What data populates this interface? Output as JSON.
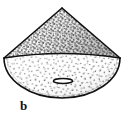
{
  "figure": {
    "caption_label": "b",
    "background_color": "#ffffff",
    "ink_color": "#111111",
    "cone_surface_color": "#8d8d8d",
    "base_surface_color": "#d6d6d6",
    "aperture_label": "",
    "parts": [
      {
        "name": "cone-lateral-surface",
        "shading": "dense stipple",
        "tone": "dark gray"
      },
      {
        "name": "cone-base-ellipse",
        "shading": "sparse stipple",
        "tone": "light gray"
      },
      {
        "name": "base-aperture-slit",
        "shading": "outline",
        "tone": "black"
      }
    ],
    "geometry": {
      "apex_x": 62,
      "apex_y": 8,
      "left_vertex_x": 4,
      "left_vertex_y": 58,
      "right_vertex_x": 120,
      "right_vertex_y": 58,
      "base_center_x": 62,
      "base_center_y": 58,
      "base_rx": 58,
      "base_ry": 40,
      "rim_back_peak_y": 55,
      "aperture_cx": 63,
      "aperture_cy": 81,
      "aperture_rx": 9,
      "aperture_ry": 2
    }
  }
}
